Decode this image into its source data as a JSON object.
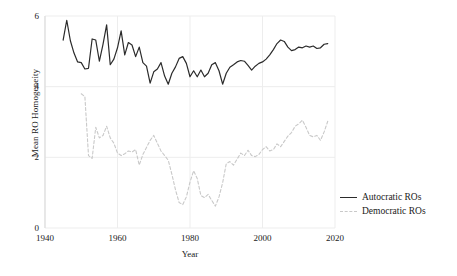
{
  "chart_data": {
    "type": "line",
    "title": "",
    "xlabel": "Year",
    "ylabel": "Mean RO Homogeneity",
    "xlim": [
      1940,
      2020
    ],
    "ylim": [
      0,
      6
    ],
    "xticks": [
      1940,
      1960,
      1980,
      2000,
      2020
    ],
    "yticks": [
      0,
      2,
      4,
      6
    ],
    "grid": true,
    "legend_position": "right",
    "colors": {
      "autocratic": "#2b2b2b",
      "democratic": "#c9c9c9",
      "grid": "#ededed",
      "axis": "#d9d9d9",
      "text": "#1a1a1a"
    },
    "series": [
      {
        "name": "Autocratic ROs",
        "style": "solid",
        "color": "#2b2b2b",
        "x": [
          1945,
          1946,
          1947,
          1948,
          1949,
          1950,
          1951,
          1952,
          1953,
          1954,
          1955,
          1956,
          1957,
          1958,
          1959,
          1960,
          1961,
          1962,
          1963,
          1964,
          1965,
          1966,
          1967,
          1968,
          1969,
          1970,
          1971,
          1972,
          1973,
          1974,
          1975,
          1976,
          1977,
          1978,
          1979,
          1980,
          1981,
          1982,
          1983,
          1984,
          1985,
          1986,
          1987,
          1988,
          1989,
          1990,
          1991,
          1992,
          1993,
          1994,
          1995,
          1996,
          1997,
          1998,
          1999,
          2000,
          2001,
          2002,
          2003,
          2004,
          2005,
          2006,
          2007,
          2008,
          2009,
          2010,
          2011,
          2012,
          2013,
          2014,
          2015,
          2016,
          2017,
          2018
        ],
        "values": [
          5.32,
          5.88,
          5.3,
          4.95,
          4.7,
          4.68,
          4.5,
          4.52,
          5.35,
          5.32,
          4.72,
          5.2,
          5.75,
          4.62,
          4.78,
          5.1,
          5.58,
          4.9,
          5.25,
          5.18,
          4.85,
          5.12,
          4.68,
          4.58,
          4.1,
          4.42,
          4.5,
          4.68,
          4.3,
          4.07,
          4.38,
          4.56,
          4.8,
          4.85,
          4.66,
          4.28,
          4.45,
          4.28,
          4.47,
          4.28,
          4.38,
          4.62,
          4.68,
          4.45,
          4.07,
          4.38,
          4.55,
          4.62,
          4.7,
          4.74,
          4.72,
          4.6,
          4.47,
          4.58,
          4.66,
          4.7,
          4.78,
          4.9,
          5.05,
          5.22,
          5.32,
          5.28,
          5.12,
          5.02,
          5.05,
          5.12,
          5.1,
          5.15,
          5.12,
          5.15,
          5.08,
          5.1,
          5.2,
          5.22
        ]
      },
      {
        "name": "Democratic ROs",
        "style": "dashed",
        "color": "#c9c9c9",
        "x": [
          1950,
          1951,
          1952,
          1953,
          1954,
          1955,
          1956,
          1957,
          1958,
          1959,
          1960,
          1961,
          1962,
          1963,
          1964,
          1965,
          1966,
          1967,
          1968,
          1969,
          1970,
          1971,
          1972,
          1973,
          1974,
          1975,
          1976,
          1977,
          1978,
          1979,
          1980,
          1981,
          1982,
          1983,
          1984,
          1985,
          1986,
          1987,
          1988,
          1989,
          1990,
          1991,
          1992,
          1993,
          1994,
          1995,
          1996,
          1997,
          1998,
          1999,
          2000,
          2001,
          2002,
          2003,
          2004,
          2005,
          2006,
          2007,
          2008,
          2009,
          2010,
          2011,
          2012,
          2013,
          2014,
          2015,
          2016,
          2017,
          2018
        ],
        "values": [
          3.8,
          3.72,
          2.05,
          1.97,
          2.85,
          2.55,
          2.62,
          2.88,
          2.55,
          2.4,
          2.12,
          2.05,
          2.1,
          2.18,
          2.15,
          2.22,
          1.78,
          2.08,
          2.28,
          2.48,
          2.62,
          2.4,
          2.18,
          2.05,
          1.92,
          1.52,
          1.08,
          0.72,
          0.66,
          0.88,
          1.3,
          1.62,
          1.4,
          0.92,
          0.86,
          0.95,
          0.78,
          0.62,
          0.88,
          1.28,
          1.82,
          1.88,
          1.78,
          1.95,
          2.12,
          2.05,
          2.2,
          2.05,
          2.02,
          2.08,
          2.22,
          2.3,
          2.18,
          2.22,
          2.38,
          2.3,
          2.45,
          2.6,
          2.7,
          2.88,
          2.95,
          3.05,
          2.85,
          2.62,
          2.58,
          2.62,
          2.48,
          2.72,
          3.02
        ]
      }
    ]
  },
  "axes": {
    "ylabel": "Mean RO Homogeneity",
    "xlabel": "Year",
    "yticks": [
      "0",
      "2",
      "4",
      "6"
    ],
    "xticks": [
      "1940",
      "1960",
      "1980",
      "2000",
      "2020"
    ]
  },
  "legend": {
    "items": [
      {
        "label": "Autocratic ROs"
      },
      {
        "label": "Democratic ROs"
      }
    ]
  }
}
